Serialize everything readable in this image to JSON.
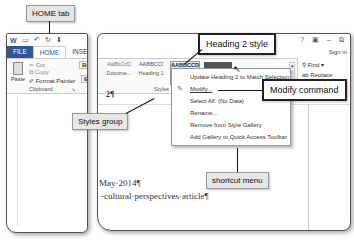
{
  "callouts": {
    "home_tab": "HOME tab",
    "heading2_style": "Heading 2 style",
    "modify_command": "Modify command",
    "styles_group": "Styles group",
    "shortcut_menu": "shortcut menu"
  },
  "window": {
    "tabs": [
      "FILE",
      "HOME",
      "INSERT"
    ],
    "window_controls": [
      "?",
      "▣",
      "–",
      "⧉"
    ],
    "sign_in": "Sign in"
  },
  "clipboard": {
    "paste": "Paste",
    "cut": "Cut",
    "copy": "Copy",
    "format_painter": "Format Painter",
    "group_label": "Clipboard",
    "font_box": "Berl",
    "bold": "B"
  },
  "styles": {
    "tiles": [
      {
        "preview": "AaBbCcD",
        "name": "Docume..."
      },
      {
        "preview": "AABBCCI",
        "name": "Heading 1"
      },
      {
        "preview": "AABBCCD",
        "name": "Hea"
      }
    ],
    "group_label": "Styles"
  },
  "editing": {
    "find": "Find",
    "replace": "Replace",
    "select": "Editing"
  },
  "context_menu": {
    "items": [
      {
        "label": "Update Heading 2 to Match Selection",
        "icon": ""
      },
      {
        "label": "Modify...",
        "icon": "✎"
      },
      {
        "label": "Select All: (No Data)",
        "icon": ""
      },
      {
        "label": "Rename...",
        "icon": ""
      },
      {
        "label": "Remove from Style Gallery",
        "icon": ""
      },
      {
        "label": "Add Gallery to Quick Access Toolbar",
        "icon": ""
      }
    ]
  },
  "document": {
    "line1": "May·2014¶",
    "line2": "-cultural·perspectives·article¶",
    "mark": "2¶"
  }
}
